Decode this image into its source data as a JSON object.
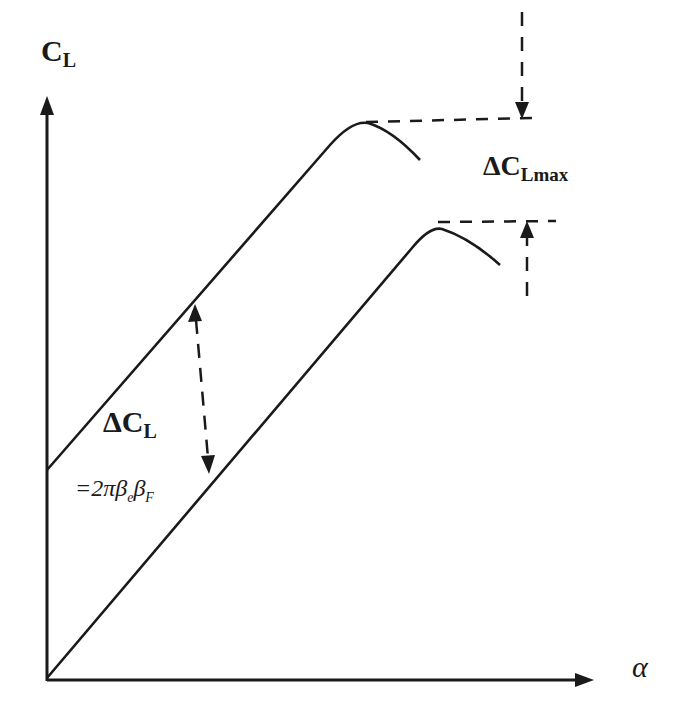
{
  "diagram": {
    "colors": {
      "line": "#1a1a1a",
      "background": "#ffffff"
    },
    "axes": {
      "y_label": {
        "main": "C",
        "sub": "L"
      },
      "x_label": "α"
    },
    "curves": [
      {
        "name": "flapped-curve",
        "description": "upper curve, shifted up, lower stall angle"
      },
      {
        "name": "baseline-curve",
        "description": "lower curve starting at origin"
      }
    ],
    "annotations": {
      "delta_cl_max": {
        "main": "ΔC",
        "sub": "Lmax"
      },
      "delta_cl": {
        "main": "ΔC",
        "sub": "L"
      },
      "formula": {
        "prefix": "=2π",
        "b1": "β",
        "b1_sub": "e",
        "b2": "β",
        "b2_sub": "F"
      }
    }
  }
}
